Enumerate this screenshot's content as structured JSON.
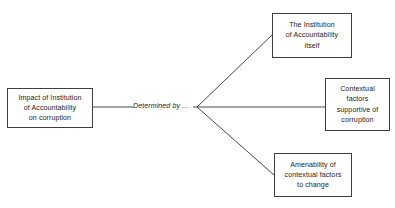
{
  "diagram": {
    "background_color": "#ffffff",
    "line_color": "#4a4a4d",
    "border_color": "#3f3f42",
    "text_color": "#1d1d1f",
    "source_node": {
      "label": "Impact of Institution\nof Accountability\non corruption"
    },
    "edge_label": {
      "text": "Determined by …"
    },
    "branch_nodes": [
      {
        "id": "institution-itself",
        "label": "The Institution\nof Accountability\nitself"
      },
      {
        "id": "contextual-factors",
        "label": "Contextual\nfactors\nsupportive of\ncorruption"
      },
      {
        "id": "amenability",
        "label": "Amenability of\ncontextual factors\nto change"
      }
    ],
    "connectors": [
      {
        "id": "source-to-vertex",
        "from": [
          93,
          107
        ],
        "to": [
          197,
          107
        ]
      },
      {
        "id": "vertex-to-institution",
        "from": [
          197,
          107
        ],
        "to": [
          272,
          35
        ]
      },
      {
        "id": "vertex-to-contextual",
        "from": [
          197,
          107
        ],
        "to": [
          325,
          107
        ]
      },
      {
        "id": "vertex-to-amenability",
        "from": [
          197,
          107
        ],
        "to": [
          274,
          175
        ]
      }
    ]
  }
}
